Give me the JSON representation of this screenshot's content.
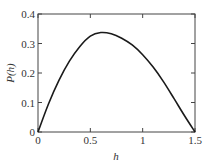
{
  "chart_data": {
    "type": "line",
    "title": "",
    "xlabel": "h",
    "ylabel": "P(h)",
    "xlim": [
      0,
      1.5
    ],
    "ylim": [
      0,
      0.4
    ],
    "grid": false,
    "legend": null,
    "x_ticks": [
      "0",
      "0.5",
      "1",
      "1.5"
    ],
    "y_ticks": [
      "0",
      "0.1",
      "0.2",
      "0.3",
      "0.4"
    ],
    "series": [
      {
        "name": "P(h)",
        "color": "#1a1a1a",
        "x": [
          0,
          0.1,
          0.2,
          0.3,
          0.4,
          0.5,
          0.6,
          0.7,
          0.8,
          0.9,
          1.0,
          1.1,
          1.2,
          1.3,
          1.4,
          1.5
        ],
        "values": [
          0,
          0.095,
          0.175,
          0.24,
          0.29,
          0.325,
          0.337,
          0.333,
          0.318,
          0.295,
          0.262,
          0.22,
          0.17,
          0.113,
          0.055,
          0
        ]
      }
    ]
  }
}
